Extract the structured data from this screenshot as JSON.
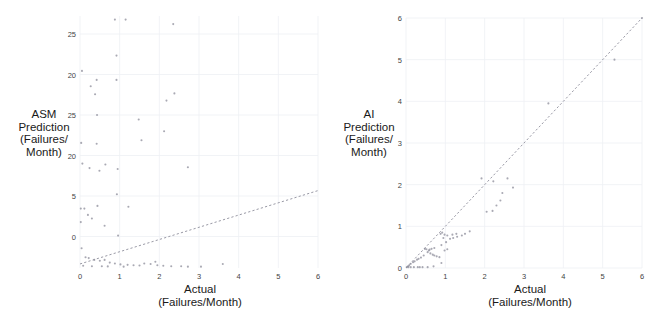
{
  "figure": {
    "width": 657,
    "height": 327,
    "background": "#ffffff",
    "point_color": "#8c8c99",
    "line_color": "#9a9aa6",
    "grid_color": "#eef0f4",
    "text_color": "#1a1a1a",
    "tick_color": "#444444"
  },
  "chart_data": [
    {
      "type": "scatter",
      "panel": "left",
      "title": "",
      "xlabel": "Actual\n(Failures/Month)",
      "ylabel": "ASM Prediction\n(Failures/\nMonth)",
      "ylabel_lines": [
        "ASM",
        "Prediction",
        "(Failures/",
        "Month)"
      ],
      "xlabel_lines": [
        "Actual",
        "(Failures/Month)"
      ],
      "xlim": [
        0,
        6
      ],
      "ylim": [
        0,
        28
      ],
      "xticks": [
        0,
        1,
        2,
        3,
        4,
        5,
        6
      ],
      "xticklabels": [
        "0",
        "1",
        "2",
        "3",
        "4",
        "5",
        "6"
      ],
      "yticks": [
        26,
        21.5,
        17,
        12.5,
        8,
        3.5
      ],
      "yticklabels": [
        "25",
        "20",
        "25",
        "20",
        "5",
        "0"
      ],
      "grid": true,
      "legend": null,
      "trendline": {
        "x": [
          0,
          6
        ],
        "y": [
          0.45,
          8.6
        ],
        "style": "dashed"
      },
      "points": [
        [
          0.88,
          27.6
        ],
        [
          1.15,
          27.6
        ],
        [
          2.35,
          27.1
        ],
        [
          0.92,
          23.6
        ],
        [
          0.05,
          21.9
        ],
        [
          0.42,
          20.9
        ],
        [
          0.27,
          20.2
        ],
        [
          0.92,
          20.9
        ],
        [
          0.38,
          19.3
        ],
        [
          2.38,
          19.4
        ],
        [
          2.18,
          18.6
        ],
        [
          0.43,
          17.0
        ],
        [
          1.48,
          16.5
        ],
        [
          2.12,
          15.2
        ],
        [
          1.55,
          14.2
        ],
        [
          0.03,
          13.9
        ],
        [
          0.42,
          13.8
        ],
        [
          0.06,
          11.6
        ],
        [
          0.24,
          11.1
        ],
        [
          0.64,
          11.5
        ],
        [
          0.49,
          10.8
        ],
        [
          0.95,
          11.0
        ],
        [
          2.72,
          11.2
        ],
        [
          0.93,
          8.2
        ],
        [
          1.22,
          6.8
        ],
        [
          0.02,
          6.6
        ],
        [
          0.11,
          6.6
        ],
        [
          0.44,
          6.9
        ],
        [
          0.2,
          5.9
        ],
        [
          0.3,
          5.5
        ],
        [
          0.02,
          5.1
        ],
        [
          0.62,
          4.7
        ],
        [
          0.96,
          3.6
        ],
        [
          0.04,
          2.2
        ],
        [
          0.14,
          1.2
        ],
        [
          0.22,
          1.1
        ],
        [
          0.36,
          0.9
        ],
        [
          0.5,
          0.8
        ],
        [
          0.62,
          0.9
        ],
        [
          0.75,
          0.6
        ],
        [
          0.88,
          0.5
        ],
        [
          1.02,
          0.4
        ],
        [
          1.2,
          0.35
        ],
        [
          1.35,
          0.3
        ],
        [
          1.5,
          0.28
        ],
        [
          1.62,
          0.5
        ],
        [
          1.78,
          0.45
        ],
        [
          1.9,
          0.7
        ],
        [
          1.95,
          0.3
        ],
        [
          2.1,
          0.25
        ],
        [
          2.3,
          0.2
        ],
        [
          2.55,
          0.2
        ],
        [
          2.72,
          0.15
        ],
        [
          3.05,
          0.15
        ],
        [
          3.6,
          0.45
        ],
        [
          0.08,
          0.25
        ],
        [
          0.3,
          0.2
        ],
        [
          0.55,
          0.2
        ],
        [
          0.7,
          0.18
        ],
        [
          1.1,
          0.15
        ]
      ]
    },
    {
      "type": "scatter",
      "panel": "right",
      "title": "",
      "xlabel": "Actual\n(Failures/Month)",
      "ylabel": "AI Prediction\n(Failures/\nMonth)",
      "ylabel_lines": [
        "AI",
        "Prediction",
        "(Failures/",
        "Month)"
      ],
      "xlabel_lines": [
        "Actual",
        "(Failures/Month)"
      ],
      "xlim": [
        0,
        6
      ],
      "ylim": [
        0,
        6
      ],
      "xticks": [
        0,
        1,
        2,
        3,
        4,
        5,
        6
      ],
      "xticklabels": [
        "0",
        "1",
        "2",
        "3",
        "4",
        "5",
        "6"
      ],
      "yticks": [
        0,
        1,
        2,
        3,
        4,
        5,
        6
      ],
      "yticklabels": [
        "0",
        "1",
        "2",
        "3",
        "4",
        "5",
        "6"
      ],
      "grid": true,
      "legend": null,
      "trendline": {
        "x": [
          0,
          6
        ],
        "y": [
          0,
          6
        ],
        "style": "dashed"
      },
      "points": [
        [
          6.0,
          6.0
        ],
        [
          5.3,
          5.0
        ],
        [
          3.62,
          3.95
        ],
        [
          2.72,
          1.93
        ],
        [
          2.58,
          2.15
        ],
        [
          2.22,
          2.08
        ],
        [
          1.92,
          2.15
        ],
        [
          2.45,
          1.8
        ],
        [
          2.4,
          1.62
        ],
        [
          2.3,
          1.5
        ],
        [
          2.2,
          1.37
        ],
        [
          2.05,
          1.35
        ],
        [
          1.62,
          0.88
        ],
        [
          1.5,
          0.82
        ],
        [
          1.42,
          0.78
        ],
        [
          1.3,
          0.75
        ],
        [
          1.2,
          0.72
        ],
        [
          1.12,
          0.7
        ],
        [
          1.28,
          0.82
        ],
        [
          1.18,
          0.8
        ],
        [
          1.05,
          0.78
        ],
        [
          0.98,
          0.8
        ],
        [
          0.92,
          0.85
        ],
        [
          0.88,
          0.82
        ],
        [
          0.95,
          0.72
        ],
        [
          1.02,
          0.62
        ],
        [
          0.9,
          0.55
        ],
        [
          1.05,
          0.45
        ],
        [
          0.98,
          0.42
        ],
        [
          0.72,
          0.48
        ],
        [
          0.65,
          0.46
        ],
        [
          0.6,
          0.44
        ],
        [
          0.58,
          0.42
        ],
        [
          0.52,
          0.45
        ],
        [
          0.48,
          0.46
        ],
        [
          0.55,
          0.38
        ],
        [
          0.62,
          0.35
        ],
        [
          0.68,
          0.32
        ],
        [
          0.72,
          0.3
        ],
        [
          0.78,
          0.28
        ],
        [
          0.85,
          0.26
        ],
        [
          0.45,
          0.3
        ],
        [
          0.38,
          0.25
        ],
        [
          0.32,
          0.22
        ],
        [
          0.28,
          0.2
        ],
        [
          0.22,
          0.16
        ],
        [
          0.18,
          0.14
        ],
        [
          0.12,
          0.1
        ],
        [
          0.08,
          0.06
        ],
        [
          0.05,
          0.04
        ],
        [
          0.02,
          0.02
        ],
        [
          0.9,
          0.12
        ],
        [
          0.7,
          0.04
        ],
        [
          0.55,
          0.02
        ],
        [
          0.42,
          0.02
        ],
        [
          0.3,
          0.02
        ],
        [
          0.2,
          0.02
        ],
        [
          0.12,
          0.02
        ],
        [
          0.06,
          0.02
        ],
        [
          0.35,
          0.02
        ]
      ]
    }
  ]
}
